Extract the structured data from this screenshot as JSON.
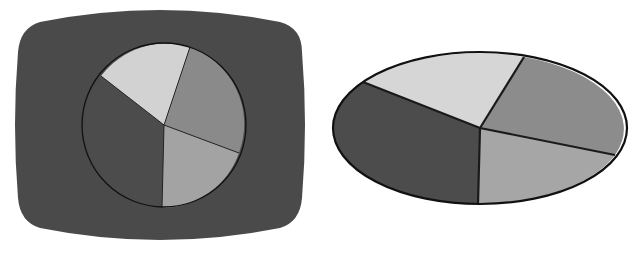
{
  "chart_data": [
    {
      "type": "pie",
      "title": "",
      "style": "pie chart displayed on rounded-rectangle TV-screen-shaped dark background",
      "background_color": "#4a4a4a",
      "center": [
        164,
        125
      ],
      "radius": 82,
      "slices": [
        {
          "name": "dark",
          "color": "#4c4c4c",
          "percent": 34
        },
        {
          "name": "light",
          "color": "#d2d2d2",
          "percent": 19
        },
        {
          "name": "mid-gray",
          "color": "#8a8a8a",
          "percent": 26
        },
        {
          "name": "light-gray",
          "color": "#a3a3a3",
          "percent": 21
        }
      ],
      "spokes": [
        [
          101,
          76
        ],
        [
          190,
          47
        ],
        [
          239,
          153
        ],
        [
          162,
          208
        ]
      ]
    },
    {
      "type": "pie",
      "title": "",
      "style": "elliptical (perspective) pie chart with thick black outlines",
      "center": [
        480,
        128
      ],
      "rx": 147,
      "ry": 76,
      "slices": [
        {
          "name": "dark",
          "color": "#4c4c4c",
          "percent": 34
        },
        {
          "name": "light",
          "color": "#d6d6d6",
          "percent": 19
        },
        {
          "name": "mid-gray",
          "color": "#8c8c8c",
          "percent": 26
        },
        {
          "name": "light-gray",
          "color": "#a6a6a6",
          "percent": 21
        }
      ],
      "spokes": [
        [
          363,
          82
        ],
        [
          524,
          57
        ],
        [
          615,
          155
        ],
        [
          478,
          204
        ]
      ]
    }
  ]
}
